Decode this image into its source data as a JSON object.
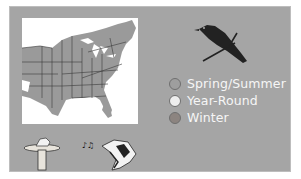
{
  "range_map": {
    "region": "Eastern United States",
    "background_color": "#a5a5a5",
    "map_fill_color": "#9a9a9a"
  },
  "legend": {
    "items": [
      {
        "label": "Spring/Summer",
        "color": "#9e9e9e"
      },
      {
        "label": "Year-Round",
        "color": "#eeeeee"
      },
      {
        "label": "Winter",
        "color": "#8c8480"
      }
    ]
  },
  "icons": {
    "bird_silhouette": "bird-silhouette-icon",
    "birdbath": "birdbath-icon",
    "singing_bird": "singing-bird-icon"
  }
}
